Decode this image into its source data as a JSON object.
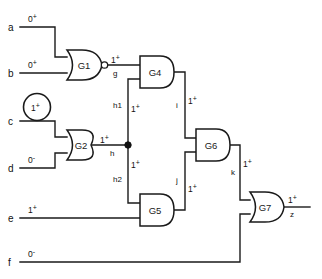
{
  "diagram": {
    "type": "logic-gate-schematic"
  },
  "inputs": [
    {
      "id": "a",
      "label": "a",
      "value": "0",
      "sign": "+"
    },
    {
      "id": "b",
      "label": "b",
      "value": "0",
      "sign": "+"
    },
    {
      "id": "c",
      "label": "c",
      "value": "1",
      "sign": "+",
      "highlighted": true
    },
    {
      "id": "d",
      "label": "d",
      "value": "0",
      "sign": "-"
    },
    {
      "id": "e",
      "label": "e",
      "value": "1",
      "sign": "+"
    },
    {
      "id": "f",
      "label": "f",
      "value": "0",
      "sign": "-"
    }
  ],
  "gates": [
    {
      "id": "G1",
      "label": "G1",
      "type": "NOR"
    },
    {
      "id": "G2",
      "label": "G2",
      "type": "OR"
    },
    {
      "id": "G4",
      "label": "G4",
      "type": "AND"
    },
    {
      "id": "G5",
      "label": "G5",
      "type": "AND"
    },
    {
      "id": "G6",
      "label": "G6",
      "type": "AND"
    },
    {
      "id": "G7",
      "label": "G7",
      "type": "OR"
    }
  ],
  "nets": [
    {
      "id": "g",
      "label": "g",
      "value": "1",
      "sign": "+"
    },
    {
      "id": "h",
      "label": "h",
      "value": "1",
      "sign": "+"
    },
    {
      "id": "h1",
      "label": "h1",
      "value": "1",
      "sign": "+"
    },
    {
      "id": "h2",
      "label": "h2",
      "value": "1",
      "sign": "+"
    },
    {
      "id": "i",
      "label": "i",
      "value": "1",
      "sign": "+"
    },
    {
      "id": "j",
      "label": "j",
      "value": "1",
      "sign": "+"
    },
    {
      "id": "k",
      "label": "k",
      "value": "1",
      "sign": "+"
    }
  ],
  "outputs": [
    {
      "id": "z",
      "label": "z",
      "value": "1",
      "sign": "+"
    }
  ],
  "colors": {
    "ink": "#1a1a1a",
    "background": "#ffffff",
    "junction": "#111111"
  }
}
